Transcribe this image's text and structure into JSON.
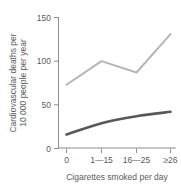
{
  "chart_data": {
    "type": "line",
    "title": "",
    "subtitle": "",
    "xlabel": "Cigarettes smoked per day",
    "ylabel": "Cardiovascular deaths per 10 000 people per year",
    "ylabel_line1": "Cardiovascular deaths per",
    "ylabel_line2": "10 000 people per year",
    "categories": [
      "0",
      "1—15",
      "16—25",
      "≥26"
    ],
    "xtick_labels": [
      "0",
      "1—15",
      "16—25",
      "≥26"
    ],
    "ytick_labels": [
      "0",
      "50",
      "100",
      "150"
    ],
    "ytick_values": [
      0,
      50,
      100,
      150
    ],
    "ylim": [
      0,
      150
    ],
    "grid": false,
    "legend": false,
    "legend_position": "none",
    "series": [
      {
        "name": "upper-series",
        "color": "#b6b6b6",
        "values": [
          73,
          100,
          87,
          131
        ]
      },
      {
        "name": "lower-series",
        "color": "#595959",
        "values": [
          16,
          29,
          37,
          42
        ]
      }
    ]
  },
  "colors": {
    "axis": "#8d8d8d",
    "text": "#5a5a5a",
    "background": "#ffffff",
    "upper_series": "#b6b6b6",
    "lower_series": "#595959"
  }
}
